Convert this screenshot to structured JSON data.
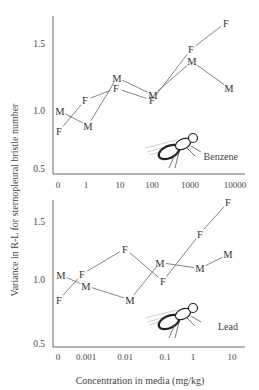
{
  "page": {
    "y_axis_label": "Variance in R-L for sternopleural bristle number",
    "x_axis_label": "Concentration in media (mg/kg)"
  },
  "chart_data": [
    {
      "type": "line",
      "title": "Benzene",
      "annotation": "Benzene",
      "xlabel": "",
      "ylabel": "Variance in R-L for sternopleural bristle number",
      "categories": [
        "0",
        "1",
        "10",
        "100",
        "1000",
        "10000"
      ],
      "y_ticks": [
        "0.5",
        "1.0",
        "1.5"
      ],
      "ylim": [
        0.5,
        1.7
      ],
      "grid": false,
      "marker_style": "letters (F = female, M = male)",
      "series": [
        {
          "name": "F",
          "x_positions": [
            59,
            85,
            116,
            152,
            191,
            226
          ],
          "values": [
            0.85,
            1.08,
            1.17,
            1.08,
            1.46,
            1.66
          ]
        },
        {
          "name": "M",
          "x_positions": [
            60,
            88,
            117,
            153,
            192,
            229
          ],
          "values": [
            1.0,
            0.89,
            1.25,
            1.12,
            1.37,
            1.17
          ]
        }
      ]
    },
    {
      "type": "line",
      "title": "Lead",
      "annotation": "Lead",
      "xlabel": "Concentration in media (mg/kg)",
      "ylabel": "Variance in R-L for sternopleural bristle number",
      "categories": [
        "0",
        "0.001",
        "0.01",
        "0.1",
        "1",
        "10"
      ],
      "y_ticks": [
        "0.5",
        "1.0",
        "1.5"
      ],
      "ylim": [
        0.5,
        1.7
      ],
      "grid": false,
      "marker_style": "letters (F = female, M = male)",
      "series": [
        {
          "name": "F",
          "x_positions": [
            59,
            82,
            125,
            163,
            200,
            228
          ],
          "values": [
            0.83,
            1.05,
            1.27,
            0.99,
            1.4,
            1.67
          ]
        },
        {
          "name": "M",
          "x_positions": [
            61,
            86,
            130,
            160,
            200,
            228
          ],
          "values": [
            1.04,
            0.95,
            0.83,
            1.15,
            1.1,
            1.22
          ]
        }
      ]
    }
  ]
}
